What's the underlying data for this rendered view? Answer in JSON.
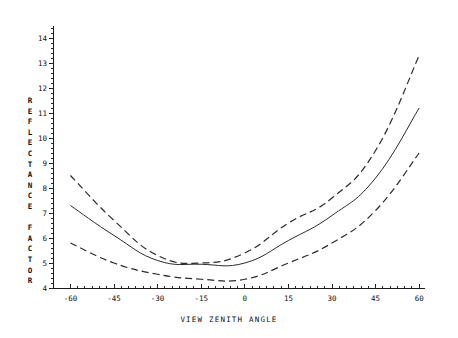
{
  "chart_data": {
    "type": "line",
    "title": "",
    "xlabel": "VIEW ZENITH ANGLE",
    "ylabel": "REFLECTANCE FACTOR",
    "x": [
      -60,
      -45,
      -30,
      -15,
      0,
      15,
      30,
      45,
      60
    ],
    "xlim": [
      -66,
      62
    ],
    "ylim": [
      4,
      14.4
    ],
    "xticks": [
      -60,
      -45,
      -30,
      -15,
      0,
      15,
      30,
      45,
      60
    ],
    "xticklabels": [
      "-60",
      "-45",
      "-30",
      "-15",
      "0",
      "15",
      "30",
      "45",
      "60"
    ],
    "yticks": [
      4,
      5,
      6,
      7,
      8,
      9,
      10,
      11,
      12,
      13,
      14
    ],
    "yticklabels": [
      "4",
      "5",
      "6",
      "7",
      "8",
      "9",
      "10",
      "11",
      "12",
      "13",
      "14"
    ],
    "minor_ticks": true,
    "grid": false,
    "legend": "none",
    "series": [
      {
        "name": "upper-bound",
        "style": "dashed",
        "values": [
          8.5,
          6.7,
          5.3,
          5.0,
          5.4,
          6.6,
          7.6,
          9.5,
          13.3
        ]
      },
      {
        "name": "mean",
        "style": "solid",
        "values": [
          7.3,
          6.1,
          5.1,
          4.95,
          5.0,
          5.9,
          6.9,
          8.4,
          11.2
        ]
      },
      {
        "name": "lower-bound",
        "style": "dashed",
        "values": [
          5.8,
          5.0,
          4.55,
          4.35,
          4.35,
          5.0,
          5.8,
          7.1,
          9.4
        ]
      }
    ]
  },
  "ylabel_chars": [
    "R",
    "E",
    "F",
    "L",
    "E",
    "C",
    "T",
    "A",
    "N",
    "C",
    "E",
    "",
    "F",
    "A",
    "C",
    "T",
    "O",
    "R"
  ]
}
